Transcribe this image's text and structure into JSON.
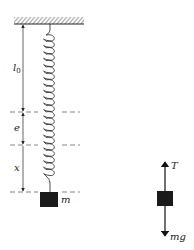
{
  "diagram": {
    "labels": {
      "natural_length": "l",
      "natural_length_sub": "0",
      "static_extension": "e",
      "displacement": "x",
      "mass": "m",
      "tension": "T",
      "weight": "mg"
    },
    "colors": {
      "ink": "#222222",
      "dash": "#555555",
      "block": "#1a1a1a",
      "background": "#ffffff"
    }
  }
}
